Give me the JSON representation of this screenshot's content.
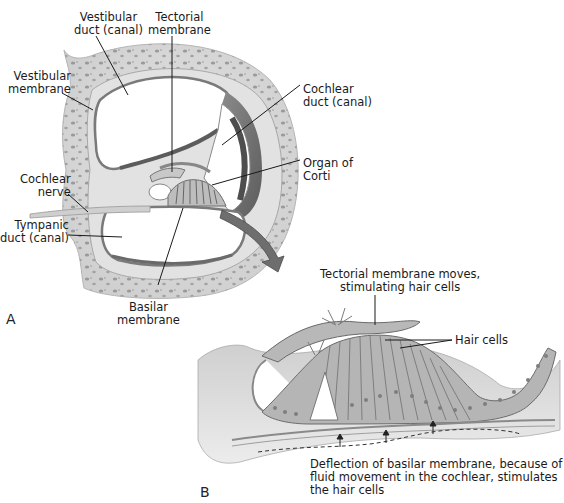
{
  "figure": {
    "panel_a": {
      "letter": "A",
      "labels": {
        "vestibular_duct": [
          "Vestibular",
          "duct (canal)"
        ],
        "tectorial_membrane": [
          "Tectorial",
          "membrane"
        ],
        "vestibular_membrane": [
          "Vestibular",
          "membrane"
        ],
        "cochlear_duct": [
          "Cochlear",
          "duct (canal)"
        ],
        "organ_of_corti": [
          "Organ of",
          "Corti"
        ],
        "cochlear_nerve": [
          "Cochlear",
          "nerve"
        ],
        "tympanic_duct": [
          "Tympanic",
          "duct (canal)"
        ],
        "basilar_membrane": [
          "Basilar",
          "membrane"
        ]
      }
    },
    "panel_b": {
      "letter": "B",
      "labels": {
        "tectorial_moves": [
          "Tectorial membrane moves,",
          "stimulating hair cells"
        ],
        "hair_cells": [
          "Hair cells"
        ],
        "deflection": [
          "Deflection of basilar membrane, because of",
          "fluid movement in the cochlear, stimulates",
          "the hair cells"
        ]
      }
    },
    "colors": {
      "bone": "#d9d9d9",
      "bone_spots": "#8f8f8f",
      "membrane": "#9a9a9a",
      "dark_wall": "#6a6a6a",
      "arrow": "#6e6e6e",
      "tissue": "#bdbdbd"
    }
  }
}
